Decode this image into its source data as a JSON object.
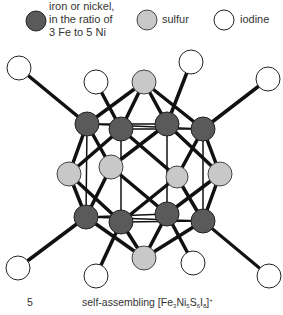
{
  "legend": {
    "metal": {
      "lines": [
        "iron or nickel,",
        "in the ratio of",
        "3 Fe to 5 Ni"
      ],
      "color": "#5a5a5a"
    },
    "sulfur": {
      "label": "sulfur",
      "color": "#c8c8c8"
    },
    "iodine": {
      "label": "iodine",
      "color": "#ffffff"
    }
  },
  "caption": {
    "number": "5",
    "prefix": "self-assembling [Fe",
    "fe_sub": "3",
    "ni": "Ni",
    "ni_sub": "5",
    "s": "S",
    "s_sub": "6",
    "i": "I",
    "i_sub": "8",
    "charge": "+"
  },
  "diagram": {
    "atoms": {
      "iodine": [
        [
          19,
          68
        ],
        [
          96,
          82
        ],
        [
          191,
          62
        ],
        [
          268,
          79
        ],
        [
          18,
          268
        ],
        [
          96,
          276
        ],
        [
          193,
          263
        ],
        [
          269,
          276
        ]
      ],
      "sulfur": [
        [
          144,
          82
        ],
        [
          69,
          174
        ],
        [
          111,
          167
        ],
        [
          177,
          177
        ],
        [
          220,
          174
        ],
        [
          144,
          258
        ]
      ],
      "metal": [
        [
          87,
          124
        ],
        [
          121,
          129
        ],
        [
          167,
          124
        ],
        [
          203,
          129
        ],
        [
          86,
          217
        ],
        [
          121,
          222
        ],
        [
          167,
          214
        ],
        [
          203,
          221
        ]
      ]
    }
  }
}
